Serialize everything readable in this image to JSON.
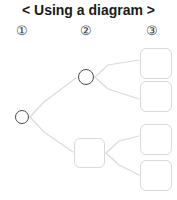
{
  "title": "< Using a diagram >",
  "columns": [
    {
      "label": "①",
      "name": "level-1"
    },
    {
      "label": "②",
      "name": "level-2"
    },
    {
      "label": "③",
      "name": "level-3"
    }
  ],
  "colors": {
    "title_text": "#1a1a1a",
    "label_text": "#3a3a3a",
    "edge_line": "#d9d9d9",
    "circle_stroke": "#4a4a4a",
    "box_stroke": "#d9d9d9",
    "node_fill": "#ffffff",
    "background": "#ffffff"
  },
  "diagram": {
    "type": "tree",
    "nodes": [
      {
        "id": "root",
        "shape": "circle",
        "label": "",
        "column": 1,
        "x": 22,
        "y": 117,
        "r": 7
      },
      {
        "id": "n2a",
        "shape": "circle",
        "label": "",
        "column": 2,
        "x": 86,
        "y": 77,
        "r": 7.5
      },
      {
        "id": "n2b",
        "shape": "rounded-square",
        "label": "",
        "column": 2,
        "x": 89,
        "y": 153,
        "w": 31,
        "h": 30
      },
      {
        "id": "n3a",
        "shape": "rounded-square",
        "label": "",
        "column": 3,
        "x": 156,
        "y": 63,
        "w": 32,
        "h": 31
      },
      {
        "id": "n3b",
        "shape": "rounded-square",
        "label": "",
        "column": 3,
        "x": 156,
        "y": 96,
        "w": 32,
        "h": 31
      },
      {
        "id": "n3c",
        "shape": "rounded-square",
        "label": "",
        "column": 3,
        "x": 156,
        "y": 139,
        "w": 32,
        "h": 31
      },
      {
        "id": "n3d",
        "shape": "rounded-square",
        "label": "",
        "column": 3,
        "x": 156,
        "y": 175,
        "w": 32,
        "h": 31
      }
    ],
    "edges": [
      {
        "from": "root",
        "to": "n2a"
      },
      {
        "from": "root",
        "to": "n2b"
      },
      {
        "from": "n2a",
        "to": "n3a"
      },
      {
        "from": "n2a",
        "to": "n3b"
      },
      {
        "from": "n2b",
        "to": "n3c"
      },
      {
        "from": "n2b",
        "to": "n3d"
      }
    ]
  }
}
